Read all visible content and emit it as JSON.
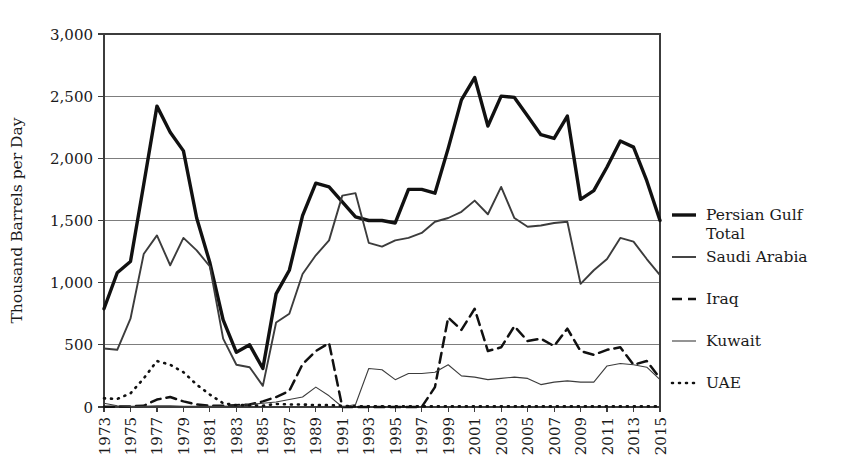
{
  "chart_data": {
    "type": "line",
    "title": "",
    "xlabel": "",
    "ylabel": "Thousand Barrels per Day",
    "ylim": [
      0,
      3000
    ],
    "xlim": [
      1973,
      2015
    ],
    "y_ticks": [
      0,
      500,
      1000,
      1500,
      2000,
      2500,
      3000
    ],
    "y_tick_labels": [
      "0",
      "500",
      "1,000",
      "1,500",
      "2,000",
      "2,500",
      "3,000"
    ],
    "x_tick_labels": [
      "1973",
      "1975",
      "1977",
      "1979",
      "1981",
      "1983",
      "1985",
      "1987",
      "1989",
      "1991",
      "1993",
      "1995",
      "1997",
      "1999",
      "2001",
      "2003",
      "2005",
      "2007",
      "2009",
      "2011",
      "2013",
      "2015"
    ],
    "grid": "horizontal",
    "legend_position": "right",
    "x": [
      1973,
      1974,
      1975,
      1976,
      1977,
      1978,
      1979,
      1980,
      1981,
      1982,
      1983,
      1984,
      1985,
      1986,
      1987,
      1988,
      1989,
      1990,
      1991,
      1992,
      1993,
      1994,
      1995,
      1996,
      1997,
      1998,
      1999,
      2000,
      2001,
      2002,
      2003,
      2004,
      2005,
      2006,
      2007,
      2008,
      2009,
      2010,
      2011,
      2012,
      2013,
      2014,
      2015
    ],
    "series": [
      {
        "name": "Persian Gulf Total",
        "style": "thick-solid",
        "color": "#111111",
        "width": 3.4,
        "dash": "",
        "values": [
          790,
          1080,
          1170,
          1790,
          2420,
          2210,
          2060,
          1520,
          1160,
          700,
          440,
          500,
          310,
          910,
          1100,
          1540,
          1800,
          1770,
          1650,
          1530,
          1500,
          1500,
          1480,
          1750,
          1750,
          1720,
          2080,
          2470,
          2650,
          2260,
          2500,
          2490,
          2340,
          2190,
          2160,
          2340,
          1670,
          1740,
          1930,
          2140,
          2090,
          1820,
          1500
        ]
      },
      {
        "name": "Saudi Arabia",
        "style": "medium-solid",
        "color": "#3c3c3c",
        "width": 1.9,
        "dash": "",
        "values": [
          470,
          460,
          710,
          1230,
          1380,
          1140,
          1360,
          1260,
          1130,
          550,
          340,
          320,
          170,
          680,
          750,
          1070,
          1220,
          1340,
          1700,
          1720,
          1320,
          1290,
          1340,
          1360,
          1400,
          1490,
          1520,
          1570,
          1660,
          1550,
          1770,
          1520,
          1450,
          1460,
          1480,
          1490,
          990,
          1100,
          1190,
          1360,
          1330,
          1190,
          1060
        ]
      },
      {
        "name": "Iraq",
        "style": "dashed",
        "color": "#111111",
        "width": 2.5,
        "dash": "10,6",
        "values": [
          2,
          3,
          5,
          10,
          60,
          80,
          45,
          20,
          10,
          10,
          15,
          20,
          45,
          80,
          130,
          345,
          450,
          515,
          0,
          0,
          0,
          0,
          0,
          0,
          0,
          160,
          720,
          620,
          790,
          450,
          480,
          650,
          530,
          550,
          490,
          630,
          450,
          420,
          460,
          480,
          340,
          370,
          230
        ]
      },
      {
        "name": "Kuwait",
        "style": "thin-solid",
        "color": "#3c3c3c",
        "width": 1.1,
        "dash": "",
        "values": [
          30,
          10,
          5,
          5,
          10,
          10,
          5,
          5,
          5,
          5,
          10,
          20,
          30,
          40,
          60,
          80,
          160,
          90,
          0,
          20,
          310,
          300,
          220,
          270,
          270,
          280,
          340,
          250,
          240,
          220,
          230,
          240,
          230,
          180,
          200,
          210,
          200,
          200,
          330,
          350,
          340,
          320,
          220
        ]
      },
      {
        "name": "UAE",
        "style": "dotted",
        "color": "#111111",
        "width": 2.6,
        "dash": "1,6",
        "values": [
          70,
          65,
          110,
          230,
          370,
          340,
          280,
          180,
          100,
          30,
          15,
          15,
          10,
          25,
          20,
          20,
          15,
          15,
          10,
          5,
          5,
          5,
          5,
          5,
          5,
          5,
          5,
          5,
          5,
          5,
          5,
          5,
          5,
          5,
          5,
          5,
          5,
          5,
          5,
          5,
          5,
          5,
          5
        ]
      }
    ]
  },
  "legend": {
    "entries": [
      {
        "label_line1": "Persian Gulf",
        "label_line2": "Total"
      },
      {
        "label_line1": "Saudi Arabia",
        "label_line2": ""
      },
      {
        "label_line1": "Iraq",
        "label_line2": ""
      },
      {
        "label_line1": "Kuwait",
        "label_line2": ""
      },
      {
        "label_line1": "UAE",
        "label_line2": ""
      }
    ]
  },
  "colors": {
    "background": "#ffffff",
    "gridline": "#7d7d7d",
    "axis": "#3c3c3c",
    "text": "#1a1a1a"
  },
  "geometry": {
    "plot_left": 104,
    "plot_top": 34,
    "plot_right": 660,
    "plot_bottom": 407
  }
}
